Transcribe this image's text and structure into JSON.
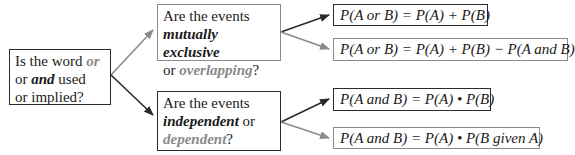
{
  "root_question": {
    "line1_pre": "Is the word ",
    "line1_em": "or",
    "line2_pre": "or ",
    "line2_em": "and",
    "line2_post": " used",
    "line3": "or implied?"
  },
  "or_question": {
    "line1": "Are the events",
    "line2_em": "mutually exclusive",
    "line3_pre": "or ",
    "line3_em": "overlapping",
    "line3_post": "?"
  },
  "and_question": {
    "line1": "Are the events",
    "line2_em": "independent",
    "line2_post": " or",
    "line3_em": "dependent",
    "line3_post": "?"
  },
  "formulas": {
    "mutually_exclusive": "P(A or B) = P(A) + P(B)",
    "overlapping": "P(A or B) = P(A) + P(B) − P(A and B)",
    "independent": "P(A and B) = P(A) • P(B)",
    "dependent": "P(A and B) = P(A) • P(B given A)"
  },
  "colors": {
    "dark": "#2a2a2a",
    "grey": "#8a8a8a"
  }
}
